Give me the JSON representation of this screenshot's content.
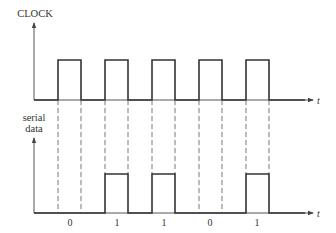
{
  "diagram": {
    "type": "timing-diagram",
    "clock": {
      "label": "CLOCK",
      "time_axis_label": "t",
      "pulses": [
        {
          "rise_x": 58,
          "fall_x": 81
        },
        {
          "rise_x": 105,
          "fall_x": 128
        },
        {
          "rise_x": 152,
          "fall_x": 175
        },
        {
          "rise_x": 199,
          "fall_x": 222
        },
        {
          "rise_x": 246,
          "fall_x": 269
        }
      ]
    },
    "serial_data": {
      "label_line1": "serial",
      "label_line2": "data",
      "time_axis_label": "t",
      "bits": [
        "0",
        "1",
        "1",
        "0",
        "1"
      ]
    },
    "colors": {
      "line": "#333333",
      "axis": "#555555",
      "dash": "#666666",
      "background": "#ffffff"
    }
  }
}
